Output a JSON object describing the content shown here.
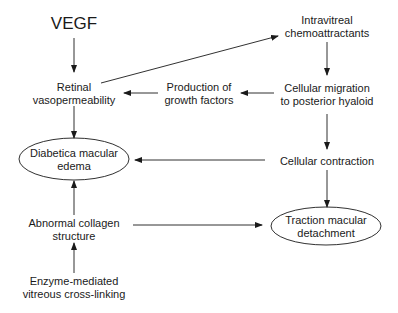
{
  "diagram": {
    "nodes": [
      {
        "id": "vegf",
        "lines": [
          "VEGF"
        ],
        "x": 74,
        "y": 24,
        "shape": "text",
        "size": "large"
      },
      {
        "id": "retinal-vasopermeability",
        "lines": [
          "Retinal",
          "vasopermeability"
        ],
        "x": 74,
        "y": 93,
        "shape": "text"
      },
      {
        "id": "production-growth-factors",
        "lines": [
          "Production of",
          "growth factors"
        ],
        "x": 168,
        "y": 93,
        "shape": "text"
      },
      {
        "id": "intravitreal-chemoattractants",
        "lines": [
          "Intravitreal",
          "chemoattractants"
        ],
        "x": 327,
        "y": 26,
        "shape": "text"
      },
      {
        "id": "cellular-migration",
        "lines": [
          "Cellular migration",
          "to posterior hyaloid"
        ],
        "x": 327,
        "y": 93,
        "shape": "text"
      },
      {
        "id": "diabetic-macular-edema",
        "lines": [
          "Diabetica macular",
          "edema"
        ],
        "x": 74,
        "y": 159,
        "shape": "ellipse"
      },
      {
        "id": "cellular-contraction",
        "lines": [
          "Cellular contraction"
        ],
        "x": 327,
        "y": 160,
        "shape": "text"
      },
      {
        "id": "abnormal-collagen",
        "lines": [
          "Abnormal collagen",
          "structure"
        ],
        "x": 74,
        "y": 227,
        "shape": "text"
      },
      {
        "id": "traction-macular-detachment",
        "lines": [
          "Traction macular",
          "detachment"
        ],
        "x": 326,
        "y": 226,
        "shape": "ellipse"
      },
      {
        "id": "enzyme-cross-linking",
        "lines": [
          "Enzyme-mediated",
          "vitreous cross-linking"
        ],
        "x": 74,
        "y": 286,
        "shape": "text"
      }
    ],
    "edges": [
      {
        "from": "vegf",
        "to": "retinal-vasopermeability"
      },
      {
        "from": "retinal-vasopermeability",
        "to": "intravitreal-chemoattractants"
      },
      {
        "from": "intravitreal-chemoattractants",
        "to": "cellular-migration"
      },
      {
        "from": "cellular-migration",
        "to": "production-growth-factors"
      },
      {
        "from": "production-growth-factors",
        "to": "retinal-vasopermeability"
      },
      {
        "from": "retinal-vasopermeability",
        "to": "diabetic-macular-edema"
      },
      {
        "from": "cellular-migration",
        "to": "cellular-contraction"
      },
      {
        "from": "cellular-contraction",
        "to": "diabetic-macular-edema"
      },
      {
        "from": "cellular-contraction",
        "to": "traction-macular-detachment"
      },
      {
        "from": "abnormal-collagen",
        "to": "diabetic-macular-edema"
      },
      {
        "from": "abnormal-collagen",
        "to": "traction-macular-detachment"
      },
      {
        "from": "enzyme-cross-linking",
        "to": "abnormal-collagen"
      }
    ],
    "colors": {
      "stroke": "#1a1a1a",
      "background": "#ffffff"
    }
  }
}
